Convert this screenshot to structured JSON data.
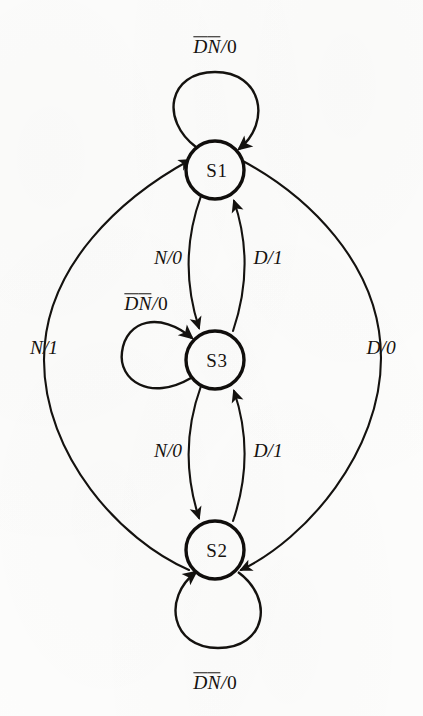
{
  "figure": {
    "kind": "state-transition-diagram",
    "background_color": "#fdfdfc",
    "ink_color": "#15120f"
  },
  "states": [
    {
      "id": "S1",
      "label": "S1",
      "cx": 215,
      "cy": 170,
      "r": 29
    },
    {
      "id": "S3",
      "label": "S3",
      "cx": 215,
      "cy": 360,
      "r": 29
    },
    {
      "id": "S2",
      "label": "S2",
      "cx": 215,
      "cy": 550,
      "r": 29
    }
  ],
  "self_loops": [
    {
      "id": "loop-s1",
      "state": "S1",
      "position": "above",
      "label_parts": [
        {
          "text": "D",
          "overline": true
        },
        {
          "text": "N",
          "overline": true
        },
        {
          "text": "/",
          "slash": true
        },
        {
          "text": "0",
          "plain": true
        }
      ],
      "label_text": "D̅N̅/0",
      "label_x": 215,
      "label_y": 47
    },
    {
      "id": "loop-s3",
      "state": "S3",
      "position": "left",
      "label_parts": [
        {
          "text": "D",
          "overline": true
        },
        {
          "text": "N",
          "overline": true
        },
        {
          "text": "/",
          "slash": true
        },
        {
          "text": "0",
          "plain": true
        }
      ],
      "label_text": "D̅N̅/0",
      "label_x": 146,
      "label_y": 304
    },
    {
      "id": "loop-s2",
      "state": "S2",
      "position": "below",
      "label_parts": [
        {
          "text": "D",
          "overline": true
        },
        {
          "text": "N",
          "overline": true
        },
        {
          "text": "/",
          "slash": true
        },
        {
          "text": "0",
          "plain": true
        }
      ],
      "label_text": "D̅N̅/0",
      "label_x": 215,
      "label_y": 683
    }
  ],
  "transitions": [
    {
      "id": "s1-to-s3",
      "from": "S1",
      "to": "S3",
      "input": "N",
      "output": "0",
      "label_text": "N/0",
      "label_x": 168,
      "label_y": 258,
      "shape": "curve-left"
    },
    {
      "id": "s3-to-s1",
      "from": "S3",
      "to": "S1",
      "input": "D",
      "output": "1",
      "label_text": "D/1",
      "label_x": 268,
      "label_y": 258,
      "shape": "curve-right"
    },
    {
      "id": "s3-to-s2",
      "from": "S3",
      "to": "S2",
      "input": "N",
      "output": "0",
      "label_text": "N/0",
      "label_x": 168,
      "label_y": 451,
      "shape": "curve-left"
    },
    {
      "id": "s2-to-s3",
      "from": "S2",
      "to": "S3",
      "input": "D",
      "output": "1",
      "label_text": "D/1",
      "label_x": 268,
      "label_y": 451,
      "shape": "curve-right"
    },
    {
      "id": "s2-to-s1",
      "from": "S2",
      "to": "S1",
      "input": "N",
      "output": "1",
      "label_text": "N/1",
      "label_x": 44,
      "label_y": 348,
      "shape": "outer-arc-left"
    },
    {
      "id": "s1-to-s2",
      "from": "S1",
      "to": "S2",
      "input": "D",
      "output": "0",
      "label_text": "D/0",
      "label_x": 381,
      "label_y": 348,
      "shape": "outer-arc-right"
    }
  ]
}
